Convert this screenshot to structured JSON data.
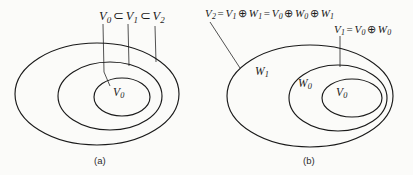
{
  "figure": {
    "background_color": "#fbfbf9",
    "stroke_color": "#1a1a1a",
    "panels": [
      {
        "id": "a",
        "caption": "(a)",
        "relation_label": "V0 ⊂ V1 ⊂ V2",
        "region_labels": [
          "V0"
        ]
      },
      {
        "id": "b",
        "caption": "(b)",
        "formulas": [
          "V2 = V1 ⊕ W1 = V0 ⊕ W0 ⊕ W1",
          "V1 = V0 ⊕ W0"
        ],
        "region_labels": [
          "W1",
          "W0",
          "V0"
        ]
      }
    ]
  },
  "panel_a": {
    "chain": {
      "v0": "V",
      "v0_sub": "0",
      "subset1": "⊂",
      "v1": "V",
      "v1_sub": "1",
      "subset2": "⊂",
      "v2": "V",
      "v2_sub": "2"
    },
    "inner_label": {
      "base": "V",
      "sub": "0"
    },
    "caption": "(a)"
  },
  "panel_b": {
    "v2_formula": {
      "lhs": "V",
      "lhs_sub": "2",
      "eq1": "=",
      "t1": "V",
      "t1_sub": "1",
      "plus1": "⊕",
      "t2": "W",
      "t2_sub": "1",
      "eq2": "=",
      "t3": "V",
      "t3_sub": "0",
      "plus2": "⊕",
      "t4": "W",
      "t4_sub": "0",
      "plus3": "⊕",
      "t5": "W",
      "t5_sub": "1"
    },
    "v1_formula": {
      "lhs": "V",
      "lhs_sub": "1",
      "eq": "=",
      "t1": "V",
      "t1_sub": "0",
      "plus": "⊕",
      "t2": "W",
      "t2_sub": "0"
    },
    "region_w1": {
      "base": "W",
      "sub": "1"
    },
    "region_w0": {
      "base": "W",
      "sub": "0"
    },
    "region_v0": {
      "base": "V",
      "sub": "0"
    },
    "caption": "(b)"
  }
}
